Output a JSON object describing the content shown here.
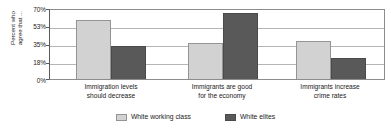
{
  "chart_data": {
    "type": "bar",
    "title": "",
    "subtitle": "",
    "xlabel": "",
    "ylabel": "Percent who agree that ...",
    "ylabel_lines": [
      "Percent who",
      "agree that ..."
    ],
    "categories": [
      "Immigration levels should decrease",
      "Immigrants are good for the economy",
      "Immigrants increase crime rates"
    ],
    "category_lines": [
      [
        "Immigration levels",
        "should decrease"
      ],
      [
        "Immigrants are good",
        "for the economy"
      ],
      [
        "Immigrants increase",
        "crime rates"
      ]
    ],
    "series": [
      {
        "name": "White working class",
        "color": "#d2d2d2",
        "values": [
          60,
          37,
          39
        ]
      },
      {
        "name": "White elites",
        "color": "#595959",
        "values": [
          34,
          67,
          21
        ]
      }
    ],
    "ylim": [
      0,
      70
    ],
    "yticks": [
      0,
      18,
      35,
      53,
      70
    ],
    "ytick_labels": [
      "0%",
      "18%",
      "35%",
      "53%",
      "70%"
    ],
    "grid": true,
    "grid_axis": "y",
    "legend_position": "bottom",
    "value_suffix": "%"
  },
  "legend": {
    "items": [
      {
        "label": "White working class",
        "color": "#d2d2d2"
      },
      {
        "label": "White elites",
        "color": "#595959"
      }
    ]
  },
  "colors": {
    "light_bar": "#d2d2d2",
    "dark_bar": "#595959",
    "gridline": "#b5b5b5",
    "axis": "#5a5a5a",
    "text": "#1a1a1a",
    "background": "#ffffff"
  }
}
